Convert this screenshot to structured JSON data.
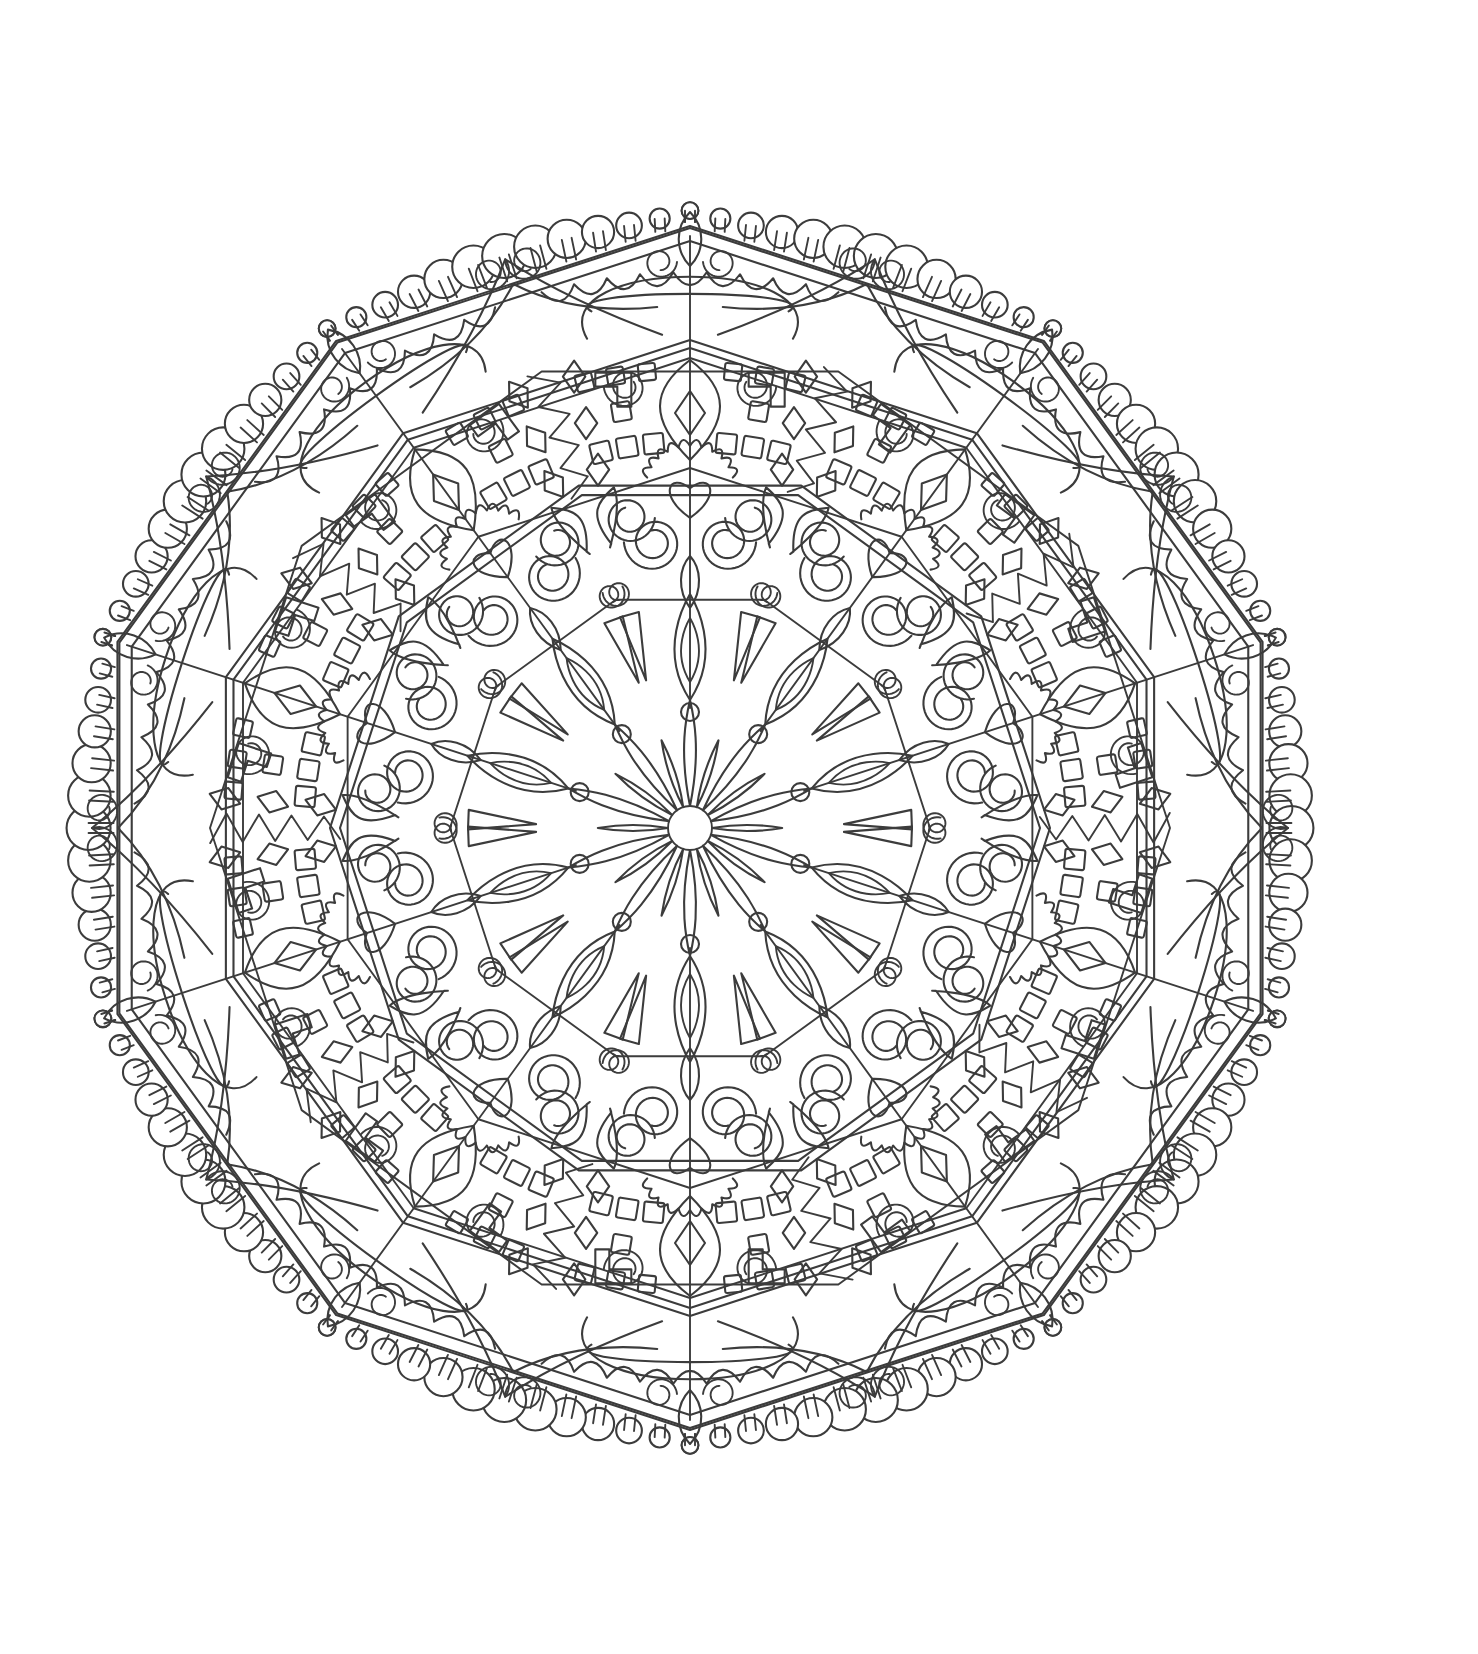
{
  "page": {
    "background_color": "#ffffff",
    "width": 1478,
    "height": 1654,
    "content_type": "line-art-illustration",
    "title": "Mandala Coloring Page"
  },
  "artwork": {
    "name": "decagonal-floral-mandala",
    "style": "black-and-white outline coloring page",
    "line_color": "#3c3c3c",
    "fill_color": "#ffffff",
    "stroke_width": 2.1,
    "symmetry_order": 10,
    "center": {
      "x": 690,
      "y": 828
    },
    "outer_radius": 652,
    "bounds": {
      "left": 42,
      "top": 118,
      "right": 1346,
      "bottom": 1492
    },
    "rings": [
      {
        "name": "beaded-scallop-border",
        "inner_radius": 600,
        "outer_radius": 652,
        "motif": "circular beads / scallops along decagon edges",
        "bead_count": 120
      },
      {
        "name": "outer-decagon-band",
        "inner_radius": 470,
        "outer_radius": 612,
        "motif": "pointed arch panels with long tapered rays and fleur-de-lis tips"
      },
      {
        "name": "lattice-ring",
        "inner_radius": 350,
        "outer_radius": 480,
        "motif": "square grid blocks, diamonds, hooks and spirals"
      },
      {
        "name": "scroll-ring",
        "inner_radius": 230,
        "outer_radius": 360,
        "motif": "paired volutes, heart-shaped blossoms, leaf fronds"
      },
      {
        "name": "petal-ring",
        "inner_radius": 120,
        "outer_radius": 240,
        "motif": "teardrop petals, triangles and curl finials"
      },
      {
        "name": "core-rosette",
        "inner_radius": 22,
        "outer_radius": 128,
        "motif": "20-petal daisy rosette with pin-head tips",
        "petal_count": 20
      }
    ],
    "colors": {
      "ink": "#3c3c3c",
      "paper": "#ffffff"
    }
  }
}
